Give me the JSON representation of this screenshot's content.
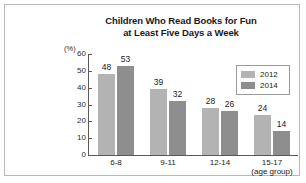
{
  "chart_data": {
    "type": "bar",
    "title": "Children Who Read Books for Fun at Least Five Days a Week",
    "title_lines": [
      "Children Who Read Books for Fun",
      "at Least Five Days a Week"
    ],
    "categories": [
      "6-8",
      "9-11",
      "12-14",
      "15-17"
    ],
    "series": [
      {
        "name": "2012",
        "values": [
          48,
          39,
          28,
          24
        ],
        "color": "#b3b3b3"
      },
      {
        "name": "2014",
        "values": [
          53,
          32,
          26,
          14
        ],
        "color": "#8e8e8e"
      }
    ],
    "xlabel": "(age group)",
    "ylabel": "(%)",
    "ylim": [
      0,
      60
    ],
    "yticks": [
      60,
      50,
      40,
      30,
      20,
      10,
      0
    ],
    "grid": false,
    "legend_position": "top-right",
    "legend_entries": [
      "2012",
      "2014"
    ],
    "data_labels": true
  }
}
